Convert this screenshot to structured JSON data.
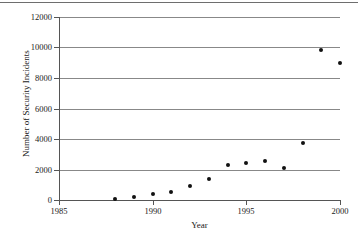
{
  "chart_data": {
    "type": "scatter",
    "title": "",
    "xlabel": "Year",
    "ylabel": "Number of Security Incidents",
    "xlim": [
      1985,
      2000
    ],
    "ylim": [
      0,
      12000
    ],
    "xticks": [
      1985,
      1990,
      1995,
      2000
    ],
    "xtick_labels": [
      "1985",
      "1990",
      "1995",
      "2000"
    ],
    "yticks": [
      0,
      2000,
      4000,
      6000,
      8000,
      10000,
      12000
    ],
    "ytick_labels": [
      "0",
      "2000",
      "4000",
      "6000",
      "8000",
      "10000",
      "12000"
    ],
    "grid": "horizontal",
    "legend": "none",
    "marker": "filled-circle",
    "marker_color": "#111111",
    "x": [
      1988,
      1989,
      1990,
      1991,
      1992,
      1993,
      1994,
      1995,
      1996,
      1997,
      1998,
      1999,
      2000
    ],
    "values": [
      60,
      200,
      400,
      500,
      950,
      1350,
      2300,
      2450,
      2550,
      2100,
      3750,
      9850,
      9000
    ],
    "points": [
      {
        "x": 1988,
        "y": 60
      },
      {
        "x": 1989,
        "y": 200
      },
      {
        "x": 1990,
        "y": 400
      },
      {
        "x": 1991,
        "y": 500
      },
      {
        "x": 1992,
        "y": 950
      },
      {
        "x": 1993,
        "y": 1350
      },
      {
        "x": 1994,
        "y": 2300
      },
      {
        "x": 1995,
        "y": 2450
      },
      {
        "x": 1996,
        "y": 2550
      },
      {
        "x": 1997,
        "y": 2100
      },
      {
        "x": 1998,
        "y": 3750
      },
      {
        "x": 1999,
        "y": 9850
      },
      {
        "x": 2000,
        "y": 9000
      }
    ]
  },
  "colors": {
    "marker": "#111111",
    "gridline": "#888888",
    "axis": "#555555",
    "page_rule": "#6e6e6e",
    "background": "#ffffff"
  }
}
